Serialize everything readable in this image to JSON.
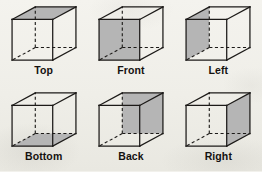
{
  "diagram": {
    "type": "orthographic-views-of-a-cube",
    "background_color": "#f2f1ec",
    "shade_color": "#b5b5b5",
    "edge_color": "#1c1a18",
    "label_color": "#14110f",
    "columns": 3,
    "rows": 2,
    "cubes": [
      {
        "label": "Top",
        "shaded_face": "top",
        "face_shape": "parallelogram-upper"
      },
      {
        "label": "Front",
        "shaded_face": "front",
        "face_shape": "square-front"
      },
      {
        "label": "Left",
        "shaded_face": "left",
        "face_shape": "parallelogram-left"
      },
      {
        "label": "Bottom",
        "shaded_face": "bottom",
        "face_shape": "parallelogram-lower"
      },
      {
        "label": "Back",
        "shaded_face": "back",
        "face_shape": "square-back"
      },
      {
        "label": "Right",
        "shaded_face": "right",
        "face_shape": "parallelogram-right"
      }
    ]
  }
}
